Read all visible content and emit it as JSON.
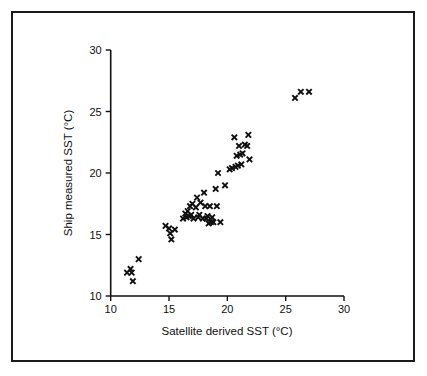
{
  "figure": {
    "background_color": "#ffffff",
    "frame_color": "#1a1a1a",
    "marker_color": "#101010",
    "marker_symbol": "x"
  },
  "chart_data": {
    "type": "scatter",
    "title": "",
    "xlabel": "Satellite  derived SST (°C)",
    "ylabel": "Ship measured SST (°C)",
    "xlim": [
      10,
      30
    ],
    "ylim": [
      10,
      30
    ],
    "xticks": [
      10,
      15,
      20,
      25,
      30
    ],
    "yticks": [
      10,
      15,
      20,
      25,
      30
    ],
    "xtick_labels": [
      "10",
      "15",
      "20",
      "25",
      "30"
    ],
    "ytick_labels": [
      "10",
      "15",
      "20",
      "25",
      "30"
    ],
    "grid": false,
    "legend": false,
    "marker": "x",
    "series": [
      {
        "name": "SST comparison",
        "x": [
          11.4,
          11.7,
          11.8,
          11.9,
          12.4,
          14.7,
          15.0,
          15.1,
          15.2,
          15.5,
          16.2,
          16.4,
          16.5,
          16.6,
          16.7,
          16.8,
          16.9,
          17.0,
          17.1,
          17.3,
          17.4,
          17.5,
          17.6,
          17.7,
          17.9,
          18.0,
          18.1,
          18.2,
          18.3,
          18.4,
          18.5,
          18.6,
          18.7,
          18.8,
          19.0,
          19.1,
          19.2,
          19.4,
          19.8,
          20.2,
          20.4,
          20.6,
          20.7,
          20.8,
          20.9,
          21.0,
          21.1,
          21.2,
          21.3,
          21.5,
          21.7,
          21.8,
          21.9,
          25.8,
          26.3,
          27.0
        ],
        "y": [
          11.9,
          12.2,
          11.9,
          11.2,
          13.0,
          15.7,
          15.5,
          15.1,
          14.6,
          15.4,
          16.3,
          16.7,
          16.4,
          16.9,
          16.5,
          17.3,
          16.6,
          17.5,
          16.3,
          17.2,
          18.0,
          16.4,
          16.6,
          17.6,
          16.3,
          18.4,
          17.3,
          16.3,
          16.5,
          15.9,
          17.3,
          16.0,
          16.4,
          16.0,
          18.7,
          17.3,
          20.0,
          16.0,
          19.0,
          20.3,
          20.4,
          22.9,
          20.5,
          21.4,
          20.6,
          22.2,
          21.5,
          20.7,
          21.6,
          22.3,
          22.2,
          23.1,
          21.1,
          26.1,
          26.6,
          26.6
        ]
      }
    ]
  }
}
